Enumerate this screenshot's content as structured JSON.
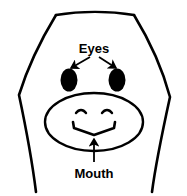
{
  "figure": {
    "background_color": "#ffffff",
    "stroke_color": "#000000",
    "fill_color": "#000000",
    "width": 187,
    "height": 196
  },
  "labels": {
    "eyes": {
      "text": "Eyes",
      "font_size": 13,
      "x": 94,
      "y": 53
    },
    "mouth": {
      "text": "Mouth",
      "font_size": 13,
      "x": 94,
      "y": 176
    }
  },
  "parts": {
    "head": {
      "name": "head-outline",
      "description": "open-bottom head contour with flat top and flared cheeks"
    },
    "left_eye": {
      "name": "left-eye",
      "cx": 69,
      "cy": 80,
      "rx": 8,
      "ry": 11
    },
    "right_eye": {
      "name": "right-eye",
      "cx": 117,
      "cy": 80,
      "rx": 8,
      "ry": 11
    },
    "muzzle": {
      "name": "muzzle-outline",
      "cx": 94,
      "cy": 122,
      "rx": 49,
      "ry": 29
    },
    "left_nostril": {
      "name": "left-nostril"
    },
    "right_nostril": {
      "name": "right-nostril"
    },
    "mouth_line": {
      "name": "mouth-line",
      "description": "wide shallow V with upturned tick ends"
    }
  },
  "annotations": {
    "eyes_arrow_left": {
      "name": "eyes-arrow-left",
      "from_x": 90,
      "from_y": 58,
      "to_x": 70,
      "to_y": 70
    },
    "eyes_arrow_right": {
      "name": "eyes-arrow-right",
      "from_x": 99,
      "from_y": 58,
      "to_x": 116,
      "to_y": 70
    },
    "mouth_arrow": {
      "name": "mouth-arrow",
      "from_x": 94,
      "from_y": 161,
      "to_x": 94,
      "to_y": 137
    }
  }
}
